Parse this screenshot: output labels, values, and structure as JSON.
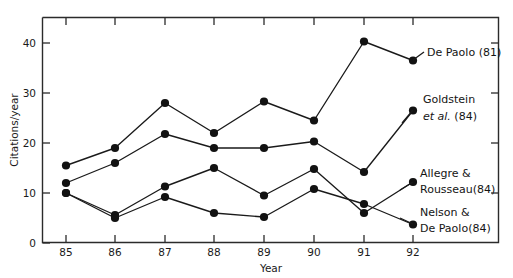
{
  "chart_data": {
    "type": "line",
    "title": "",
    "xlabel": "Year",
    "ylabel": "Citations/year",
    "x": [
      85,
      86,
      87,
      88,
      89,
      90,
      91,
      92
    ],
    "xtick_labels": [
      "85",
      "86",
      "87",
      "88",
      "89",
      "90",
      "91",
      "92"
    ],
    "ytick_labels": [
      "0",
      "10",
      "20",
      "30",
      "40"
    ],
    "ytick_values": [
      0,
      10,
      20,
      30,
      40
    ],
    "xlim": [
      84.6,
      93.3
    ],
    "ylim": [
      0,
      44.5
    ],
    "grid": false,
    "legend_position": "inline-right-annotations",
    "marker": "filled-circle",
    "series": [
      {
        "name": "De Paolo (81)",
        "label_lines": [
          "De Paolo (81)"
        ],
        "label_italic_line": null,
        "values": [
          15.5,
          19.0,
          28.0,
          22.0,
          28.3,
          24.5,
          40.3,
          36.5
        ]
      },
      {
        "name": "Goldstein et al. (84)",
        "label_lines": [
          "Goldstein",
          "et al. (84)"
        ],
        "label_italic_line": "et al.",
        "values": [
          12.0,
          16.0,
          21.8,
          19.0,
          19.0,
          20.3,
          14.2,
          26.5
        ]
      },
      {
        "name": "Allegre & Rousseau (84)",
        "label_lines": [
          "Allegre &",
          "Rousseau(84)"
        ],
        "label_italic_line": null,
        "values": [
          10.0,
          5.6,
          11.3,
          15.0,
          9.5,
          14.8,
          6.0,
          12.2
        ]
      },
      {
        "name": "Nelson & De Paolo (84)",
        "label_lines": [
          "Nelson &",
          "De Paolo(84)"
        ],
        "label_italic_line": null,
        "values": [
          10.0,
          5.0,
          9.2,
          6.0,
          5.2,
          10.8,
          7.8,
          3.7
        ]
      }
    ]
  },
  "annotations": {
    "de_paolo_line1": "De Paolo (81)",
    "goldstein_line1": "Goldstein",
    "goldstein_line2_italic": "et al.",
    "goldstein_line2_rest": " (84)",
    "allegre_line1": "Allegre &",
    "allegre_line2": "Rousseau(84)",
    "nelson_line1": "Nelson &",
    "nelson_line2": "De Paolo(84)"
  },
  "axes": {
    "x_title": "Year",
    "y_title": "Citations/year",
    "y_ticks": [
      "0",
      "10",
      "20",
      "30",
      "40"
    ],
    "x_ticks": [
      "85",
      "86",
      "87",
      "88",
      "89",
      "90",
      "91",
      "92"
    ]
  }
}
